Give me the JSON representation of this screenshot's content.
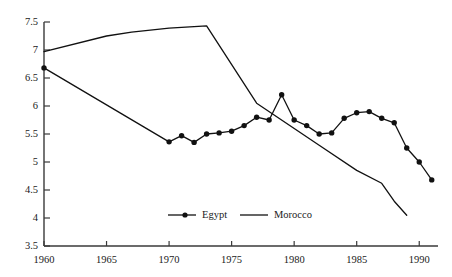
{
  "chart_data": {
    "type": "line",
    "title": "",
    "subtitle": "",
    "xlabel": "",
    "ylabel": "",
    "xlim": [
      1960,
      1991.5
    ],
    "ylim": [
      3.5,
      7.5
    ],
    "grid": false,
    "legend_position": "bottom-center",
    "x_ticks": [
      1960,
      1965,
      1970,
      1975,
      1980,
      1985,
      1990
    ],
    "x_tick_labels": [
      "1960",
      "1965",
      "1970",
      "1975",
      "1980",
      "1985",
      "1990"
    ],
    "y_ticks": [
      3.5,
      4,
      4.5,
      5,
      5.5,
      6,
      6.5,
      7,
      7.5
    ],
    "y_tick_labels": [
      "3.5",
      "4",
      "4.5",
      "5",
      "5.5",
      "6",
      "6.5",
      "7",
      "7.5"
    ],
    "series": [
      {
        "name": "Egypt",
        "marker": "filled-circle",
        "color": "#111111",
        "x": [
          1960,
          1970,
          1971,
          1972,
          1973,
          1974,
          1975,
          1976,
          1977,
          1978,
          1979,
          1980,
          1981,
          1982,
          1983,
          1984,
          1985,
          1986,
          1987,
          1988,
          1989,
          1990,
          1991
        ],
        "values": [
          6.68,
          5.36,
          5.47,
          5.35,
          5.5,
          5.52,
          5.55,
          5.65,
          5.8,
          5.75,
          6.2,
          5.75,
          5.65,
          5.5,
          5.52,
          5.78,
          5.88,
          5.9,
          5.78,
          5.7,
          5.25,
          5.0,
          4.68
        ]
      },
      {
        "name": "Morocco",
        "marker": "none",
        "color": "#111111",
        "x": [
          1960,
          1965,
          1967,
          1970,
          1973,
          1977,
          1982,
          1985,
          1987,
          1988,
          1989
        ],
        "values": [
          6.97,
          7.25,
          7.32,
          7.39,
          7.43,
          6.05,
          5.3,
          4.85,
          4.62,
          4.3,
          4.05
        ]
      }
    ],
    "legend": [
      {
        "label": "Egypt",
        "marker": "filled-circle",
        "line": true
      },
      {
        "label": "Morocco",
        "marker": "none",
        "line": true
      }
    ]
  },
  "colors": {
    "axis": "#3a3a3a",
    "egypt": "#111111",
    "morocco": "#111111",
    "background": "#ffffff"
  }
}
